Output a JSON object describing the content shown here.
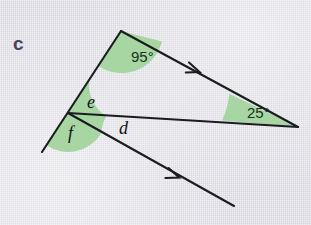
{
  "figure": {
    "part_label": "c",
    "background_color": "#d9d9e1",
    "line_color": "#1b1b22",
    "wedge_color": "#a7d6a3",
    "label_color": "#4a4060"
  },
  "angles": [
    {
      "id": "angle-95",
      "label": "95°",
      "kind": "measure",
      "vertex": "apex",
      "x": 131,
      "y": 62
    },
    {
      "id": "angle-25",
      "label": "25°",
      "kind": "measure",
      "vertex": "right",
      "x": 247,
      "y": 118
    },
    {
      "id": "angle-e",
      "label": "e",
      "kind": "variable",
      "vertex": "left",
      "x": 87,
      "y": 108
    },
    {
      "id": "angle-f",
      "label": "f",
      "kind": "variable",
      "vertex": "left",
      "x": 68,
      "y": 139
    },
    {
      "id": "angle-d",
      "label": "d",
      "kind": "variable",
      "vertex": "left",
      "x": 119,
      "y": 134
    }
  ],
  "points": {
    "apex": {
      "x": 121,
      "y": 31
    },
    "left_vertex": {
      "x": 68,
      "y": 113
    },
    "right_vertex": {
      "x": 298,
      "y": 127
    },
    "lower_left_end": {
      "x": 42,
      "y": 152
    },
    "lower_ray_end": {
      "x": 234,
      "y": 206
    }
  },
  "arrow_markers": [
    {
      "id": "arrow-upper",
      "x": 198,
      "y": 71
    },
    {
      "id": "arrow-lower",
      "x": 178,
      "y": 177
    }
  ]
}
